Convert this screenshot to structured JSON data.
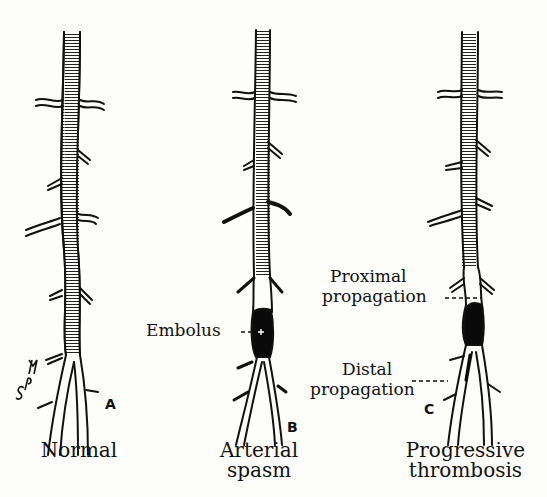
{
  "figure": {
    "panels": [
      {
        "id": "A",
        "letter": "A",
        "caption_line1": "Normal",
        "caption_line2": ""
      },
      {
        "id": "B",
        "letter": "B",
        "caption_line1": "Arterial",
        "caption_line2": "spasm"
      },
      {
        "id": "C",
        "letter": "C",
        "caption_line1": "Progressive",
        "caption_line2": "thrombosis"
      }
    ],
    "annotations": {
      "embolus": "Embolus",
      "proximal_line1": "Proximal",
      "proximal_line2": "propagation",
      "distal_line1": "Distal",
      "distal_line2": "propagation"
    },
    "signature": "SPM",
    "colors": {
      "ink": "#111111",
      "background": "#fdfdfb",
      "clot": "#0a0a0a"
    }
  }
}
